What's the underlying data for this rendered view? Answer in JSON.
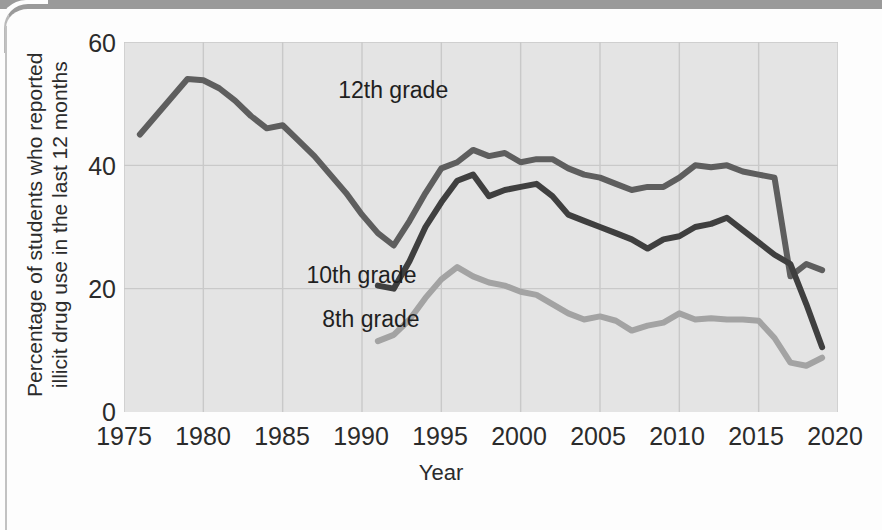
{
  "figure": {
    "ylabel": "Percentage of students who reported illicit drug use in the last 12 months",
    "ylabel_line1": "Percentage of students who reported",
    "ylabel_line2": "illicit drug use in the last 12 months",
    "xlabel": "Year",
    "yticks": [
      "0",
      "20",
      "40",
      "60"
    ],
    "xticks": [
      "1975",
      "1980",
      "1985",
      "1990",
      "1995",
      "2000",
      "2005",
      "2010",
      "2015",
      "2020"
    ],
    "labels": {
      "grade12": "12th grade",
      "grade10": "10th grade",
      "grade8": "8th grade"
    },
    "colors": {
      "plot_background": "#e4e4e4",
      "gridline": "#c9c9c9",
      "grade12": "#5e5e5e",
      "grade10": "#3f3f3f",
      "grade8": "#a3a3a3",
      "text": "#2b2b2b",
      "page": "#fdfdfd",
      "scan_band": "#9a9a9a"
    }
  },
  "chart_data": {
    "type": "line",
    "title": "",
    "xlabel": "Year",
    "ylabel": "Percentage of students who reported illicit drug use in the last 12 months",
    "xlim": [
      1975,
      2020
    ],
    "ylim": [
      0,
      60
    ],
    "xticks": [
      1975,
      1980,
      1985,
      1990,
      1995,
      2000,
      2005,
      2010,
      2015,
      2020
    ],
    "yticks": [
      0,
      20,
      40,
      60
    ],
    "grid": true,
    "legend": "inline-annotations",
    "series": [
      {
        "name": "12th grade",
        "color": "#5e5e5e",
        "points": [
          [
            1976,
            45.0
          ],
          [
            1977,
            48.0
          ],
          [
            1978,
            51.0
          ],
          [
            1979,
            54.0
          ],
          [
            1980,
            53.8
          ],
          [
            1981,
            52.5
          ],
          [
            1982,
            50.5
          ],
          [
            1983,
            48.0
          ],
          [
            1984,
            46.0
          ],
          [
            1985,
            46.5
          ],
          [
            1986,
            44.0
          ],
          [
            1987,
            41.5
          ],
          [
            1988,
            38.5
          ],
          [
            1989,
            35.5
          ],
          [
            1990,
            32.0
          ],
          [
            1991,
            29.0
          ],
          [
            1992,
            27.0
          ],
          [
            1993,
            31.0
          ],
          [
            1994,
            35.5
          ],
          [
            1995,
            39.5
          ],
          [
            1996,
            40.5
          ],
          [
            1997,
            42.5
          ],
          [
            1998,
            41.5
          ],
          [
            1999,
            42.0
          ],
          [
            2000,
            40.5
          ],
          [
            2001,
            41.0
          ],
          [
            2002,
            41.0
          ],
          [
            2003,
            39.5
          ],
          [
            2004,
            38.5
          ],
          [
            2005,
            38.0
          ],
          [
            2006,
            37.0
          ],
          [
            2007,
            36.0
          ],
          [
            2008,
            36.5
          ],
          [
            2009,
            36.5
          ],
          [
            2010,
            38.0
          ],
          [
            2011,
            40.0
          ],
          [
            2012,
            39.7
          ],
          [
            2013,
            40.0
          ],
          [
            2014,
            39.0
          ],
          [
            2015,
            38.5
          ],
          [
            2016,
            38.0
          ],
          [
            2017,
            22.0
          ],
          [
            2018,
            24.0
          ],
          [
            2019,
            23.0
          ]
        ]
      },
      {
        "name": "10th grade",
        "color": "#3f3f3f",
        "points": [
          [
            1991,
            20.5
          ],
          [
            1992,
            20.0
          ],
          [
            1993,
            24.5
          ],
          [
            1994,
            30.0
          ],
          [
            1995,
            34.0
          ],
          [
            1996,
            37.5
          ],
          [
            1997,
            38.5
          ],
          [
            1998,
            35.0
          ],
          [
            1999,
            36.0
          ],
          [
            2000,
            36.5
          ],
          [
            2001,
            37.0
          ],
          [
            2002,
            35.0
          ],
          [
            2003,
            32.0
          ],
          [
            2004,
            31.0
          ],
          [
            2005,
            30.0
          ],
          [
            2006,
            29.0
          ],
          [
            2007,
            28.0
          ],
          [
            2008,
            26.5
          ],
          [
            2009,
            28.0
          ],
          [
            2010,
            28.5
          ],
          [
            2011,
            30.0
          ],
          [
            2012,
            30.5
          ],
          [
            2013,
            31.5
          ],
          [
            2014,
            29.5
          ],
          [
            2015,
            27.5
          ],
          [
            2016,
            25.5
          ],
          [
            2017,
            24.0
          ],
          [
            2018,
            17.5
          ],
          [
            2019,
            10.5
          ]
        ]
      },
      {
        "name": "8th grade",
        "color": "#a3a3a3",
        "points": [
          [
            1991,
            11.5
          ],
          [
            1992,
            12.5
          ],
          [
            1993,
            15.0
          ],
          [
            1994,
            18.5
          ],
          [
            1995,
            21.5
          ],
          [
            1996,
            23.5
          ],
          [
            1997,
            22.0
          ],
          [
            1998,
            21.0
          ],
          [
            1999,
            20.5
          ],
          [
            2000,
            19.5
          ],
          [
            2001,
            19.0
          ],
          [
            2002,
            17.5
          ],
          [
            2003,
            16.0
          ],
          [
            2004,
            15.0
          ],
          [
            2005,
            15.5
          ],
          [
            2006,
            14.8
          ],
          [
            2007,
            13.2
          ],
          [
            2008,
            14.0
          ],
          [
            2009,
            14.5
          ],
          [
            2010,
            16.0
          ],
          [
            2011,
            15.0
          ],
          [
            2012,
            15.2
          ],
          [
            2013,
            15.0
          ],
          [
            2014,
            15.0
          ],
          [
            2015,
            14.8
          ],
          [
            2016,
            12.0
          ],
          [
            2017,
            8.0
          ],
          [
            2018,
            7.5
          ],
          [
            2019,
            8.8
          ]
        ]
      }
    ],
    "annotations": [
      {
        "text": "12th grade",
        "x": 1988.5,
        "y": 52
      },
      {
        "text": "10th grade",
        "x": 1986.5,
        "y": 22
      },
      {
        "text": "8th grade",
        "x": 1987.5,
        "y": 15
      }
    ]
  }
}
